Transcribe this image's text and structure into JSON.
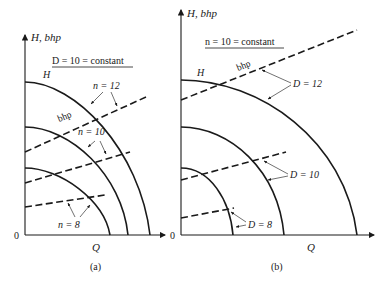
{
  "panels": [
    {
      "id": "a",
      "caption": "(a)",
      "y_axis_label": "H, bhp",
      "x_axis_label": "Q",
      "origin_label": "0",
      "constant_label": "D = 10 = constant",
      "head_label": "H",
      "bhp_label": "bhp",
      "series_labels": [
        "n = 12",
        "n = 10",
        "n = 8"
      ]
    },
    {
      "id": "b",
      "caption": "(b)",
      "y_axis_label": "H, bhp",
      "x_axis_label": "Q",
      "origin_label": "0",
      "constant_label": "n = 10 = constant",
      "head_label": "H",
      "bhp_label": "bhp",
      "series_labels": [
        "D = 12",
        "D = 10",
        "D = 8"
      ]
    }
  ],
  "colors": {
    "ink": "#1a1a1a"
  }
}
